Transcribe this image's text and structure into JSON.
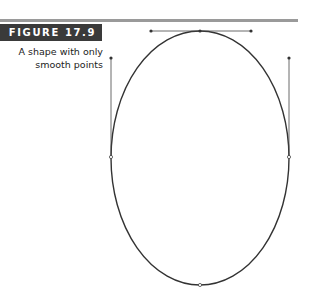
{
  "figure": {
    "label": "FIGURE 17.9",
    "caption_line1": "A shape with only",
    "caption_line2": "smooth points"
  },
  "colors": {
    "label_bg": "#3a3a3a",
    "rule": "#9a9a9a",
    "path": "#333333"
  },
  "shape": {
    "type": "ellipse",
    "center": [
      200,
      158
    ],
    "rx": 89,
    "ry": 127,
    "anchor_points": [
      {
        "name": "top",
        "x": 200,
        "y": 31,
        "handles": [
          [
            151,
            31
          ],
          [
            251,
            31
          ]
        ]
      },
      {
        "name": "left",
        "x": 111,
        "y": 157,
        "handles": [
          [
            111,
            58
          ]
        ]
      },
      {
        "name": "right",
        "x": 289,
        "y": 157,
        "handles": [
          [
            289,
            58
          ]
        ]
      },
      {
        "name": "bottom",
        "x": 200,
        "y": 285,
        "handles": []
      }
    ]
  }
}
